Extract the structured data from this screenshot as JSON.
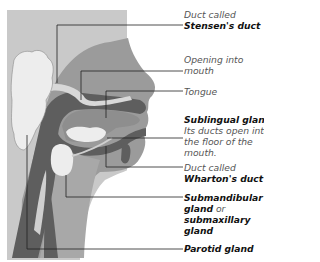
{
  "figure": {
    "colors": {
      "background": "#c9c9c9",
      "head": "#9b9b9b",
      "dark": "#5e5e5e",
      "gland": "#ededed",
      "leader_line": "#222222"
    }
  },
  "labels": [
    {
      "id": "stensens-duct",
      "prefix": "Duct called",
      "bold": "Stensen's duct",
      "suffix": ""
    },
    {
      "id": "opening-into-mouth",
      "prefix": "Opening into",
      "line2": "mouth"
    },
    {
      "id": "tongue",
      "prefix": "Tongue"
    },
    {
      "id": "sublingual-gland",
      "bold": "Sublingual gland",
      "suffix": ".",
      "line2": "Its ducts open into",
      "line3": "the floor of the",
      "line4": "mouth."
    },
    {
      "id": "whartons-duct",
      "prefix": "Duct called",
      "bold": "Wharton's duct"
    },
    {
      "id": "submandibular-gland",
      "bold": "Submandibular",
      "line2_bold": "gland",
      "line2_rest": " or",
      "line3_bold": "submaxillary",
      "line4_bold": "gland"
    },
    {
      "id": "parotid-gland",
      "bold": "Parotid gland"
    }
  ]
}
